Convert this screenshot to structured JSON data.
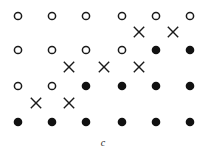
{
  "figure": {
    "caption": "c",
    "columns_x": [
      18,
      52,
      86,
      122,
      156,
      190
    ],
    "rows_y": [
      16,
      50,
      86,
      122
    ],
    "colors": {
      "stroke": "#1a1a1a",
      "fill": "#111111",
      "background": "#ffffff"
    },
    "lattice": [
      [
        "open",
        "open",
        "open",
        "open",
        "open",
        "open"
      ],
      [
        "open",
        "open",
        "open",
        "open",
        "filled",
        "filled"
      ],
      [
        "open",
        "open",
        "filled",
        "filled",
        "filled",
        "filled"
      ],
      [
        "filled",
        "filled",
        "filled",
        "filled",
        "filled",
        "filled"
      ]
    ],
    "crosses": [
      {
        "x": 139,
        "y": 32
      },
      {
        "x": 173,
        "y": 32
      },
      {
        "x": 69,
        "y": 67
      },
      {
        "x": 104,
        "y": 67
      },
      {
        "x": 139,
        "y": 67
      },
      {
        "x": 36,
        "y": 103
      },
      {
        "x": 69,
        "y": 103
      }
    ],
    "legend": {
      "open": "open-circle",
      "filled": "filled-circle",
      "cross": "x-mark"
    }
  }
}
